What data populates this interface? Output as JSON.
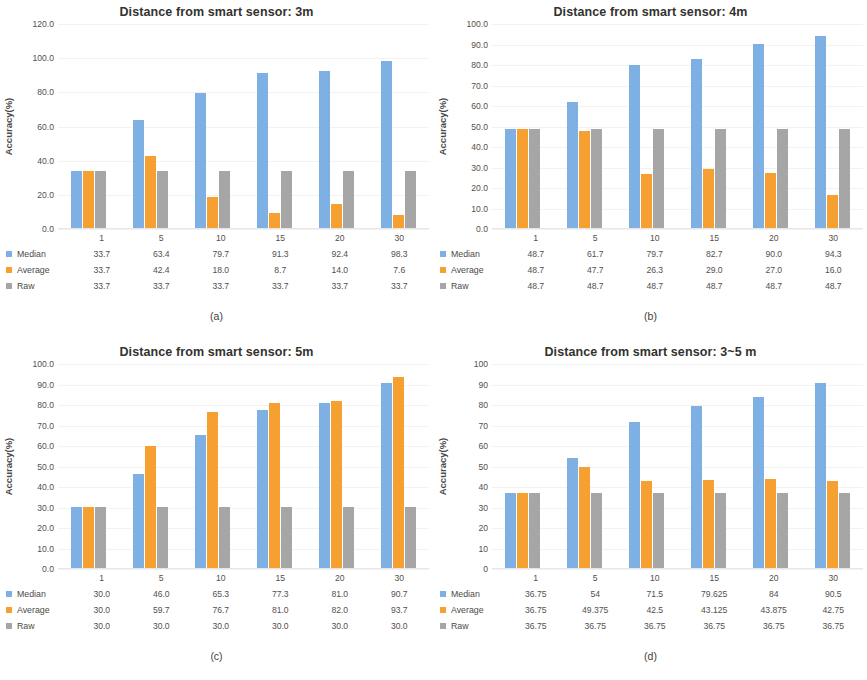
{
  "figure": {
    "series_names": [
      "Median",
      "Average",
      "Raw"
    ],
    "colors": {
      "median": "#7fb0e3",
      "average": "#f6a032",
      "raw": "#a6a6a6"
    },
    "ylabel": "Accuracy(%)"
  },
  "chart_data": [
    {
      "type": "bar",
      "panel": "a",
      "caption": "(a)",
      "title": "Distance from smart sensor: 3m",
      "xlabel": "",
      "ylabel": "Accuracy(%)",
      "ylim": [
        0,
        120
      ],
      "ytick_step": 20,
      "yticks": [
        "0.0",
        "20.0",
        "40.0",
        "60.0",
        "80.0",
        "100.0",
        "120.0"
      ],
      "grid": true,
      "legend_position": "table-left",
      "categories": [
        "1",
        "5",
        "10",
        "15",
        "20",
        "30"
      ],
      "series": [
        {
          "name": "Median",
          "values": [
            33.7,
            63.4,
            79.7,
            91.3,
            92.4,
            98.3
          ],
          "labels": [
            "33.7",
            "63.4",
            "79.7",
            "91.3",
            "92.4",
            "98.3"
          ]
        },
        {
          "name": "Average",
          "values": [
            33.7,
            42.4,
            18.0,
            8.7,
            14.0,
            7.6
          ],
          "labels": [
            "33.7",
            "42.4",
            "18.0",
            "8.7",
            "14.0",
            "7.6"
          ]
        },
        {
          "name": "Raw",
          "values": [
            33.7,
            33.7,
            33.7,
            33.7,
            33.7,
            33.7
          ],
          "labels": [
            "33.7",
            "33.7",
            "33.7",
            "33.7",
            "33.7",
            "33.7"
          ]
        }
      ]
    },
    {
      "type": "bar",
      "panel": "b",
      "caption": "(b)",
      "title": "Distance from smart sensor: 4m",
      "xlabel": "",
      "ylabel": "Accuracy(%)",
      "ylim": [
        0,
        100
      ],
      "ytick_step": 10,
      "yticks": [
        "0.0",
        "10.0",
        "20.0",
        "30.0",
        "40.0",
        "50.0",
        "60.0",
        "70.0",
        "80.0",
        "90.0",
        "100.0"
      ],
      "grid": true,
      "legend_position": "table-left",
      "categories": [
        "1",
        "5",
        "10",
        "15",
        "20",
        "30"
      ],
      "series": [
        {
          "name": "Median",
          "values": [
            48.7,
            61.7,
            79.7,
            82.7,
            90.0,
            94.3
          ],
          "labels": [
            "48.7",
            "61.7",
            "79.7",
            "82.7",
            "90.0",
            "94.3"
          ]
        },
        {
          "name": "Average",
          "values": [
            48.7,
            47.7,
            26.3,
            29.0,
            27.0,
            16.0
          ],
          "labels": [
            "48.7",
            "47.7",
            "26.3",
            "29.0",
            "27.0",
            "16.0"
          ]
        },
        {
          "name": "Raw",
          "values": [
            48.7,
            48.7,
            48.7,
            48.7,
            48.7,
            48.7
          ],
          "labels": [
            "48.7",
            "48.7",
            "48.7",
            "48.7",
            "48.7",
            "48.7"
          ]
        }
      ]
    },
    {
      "type": "bar",
      "panel": "c",
      "caption": "(c)",
      "title": "Distance from smart sensor: 5m",
      "xlabel": "",
      "ylabel": "Accuracy(%)",
      "ylim": [
        0,
        100
      ],
      "ytick_step": 10,
      "yticks": [
        "0.0",
        "10.0",
        "20.0",
        "30.0",
        "40.0",
        "50.0",
        "60.0",
        "70.0",
        "80.0",
        "90.0",
        "100.0"
      ],
      "grid": true,
      "legend_position": "table-left",
      "categories": [
        "1",
        "5",
        "10",
        "15",
        "20",
        "30"
      ],
      "series": [
        {
          "name": "Median",
          "values": [
            30.0,
            46.0,
            65.3,
            77.3,
            81.0,
            90.7
          ],
          "labels": [
            "30.0",
            "46.0",
            "65.3",
            "77.3",
            "81.0",
            "90.7"
          ]
        },
        {
          "name": "Average",
          "values": [
            30.0,
            59.7,
            76.7,
            81.0,
            82.0,
            93.7
          ],
          "labels": [
            "30.0",
            "59.7",
            "76.7",
            "81.0",
            "82.0",
            "93.7"
          ]
        },
        {
          "name": "Raw",
          "values": [
            30.0,
            30.0,
            30.0,
            30.0,
            30.0,
            30.0
          ],
          "labels": [
            "30.0",
            "30.0",
            "30.0",
            "30.0",
            "30.0",
            "30.0"
          ]
        }
      ]
    },
    {
      "type": "bar",
      "panel": "d",
      "caption": "(d)",
      "title": "Distance from smart sensor: 3~5 m",
      "xlabel": "",
      "ylabel": "Accuracy(%)",
      "ylim": [
        0,
        100
      ],
      "ytick_step": 10,
      "yticks": [
        "0",
        "10",
        "20",
        "30",
        "40",
        "50",
        "60",
        "70",
        "80",
        "90",
        "100"
      ],
      "grid": true,
      "legend_position": "table-left",
      "categories": [
        "1",
        "5",
        "10",
        "15",
        "20",
        "30"
      ],
      "series": [
        {
          "name": "Median",
          "values": [
            36.75,
            54,
            71.5,
            79.625,
            84,
            90.5
          ],
          "labels": [
            "36.75",
            "54",
            "71.5",
            "79.625",
            "84",
            "90.5"
          ]
        },
        {
          "name": "Average",
          "values": [
            36.75,
            49.375,
            42.5,
            43.125,
            43.875,
            42.75
          ],
          "labels": [
            "36.75",
            "49.375",
            "42.5",
            "43.125",
            "43.875",
            "42.75"
          ]
        },
        {
          "name": "Raw",
          "values": [
            36.75,
            36.75,
            36.75,
            36.75,
            36.75,
            36.75
          ],
          "labels": [
            "36.75",
            "36.75",
            "36.75",
            "36.75",
            "36.75",
            "36.75"
          ]
        }
      ]
    }
  ]
}
